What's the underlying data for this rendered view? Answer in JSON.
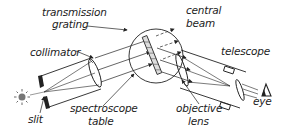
{
  "diagram": {
    "labels": {
      "transmission": "transmission",
      "grating": "grating",
      "collimator": "collimator",
      "central_beam_1": "central",
      "central_beam_2": "beam",
      "telescope": "telescope",
      "slit": "slit",
      "spectroscope_table_1": "spectroscope",
      "spectroscope_table_2": "table",
      "objective_lens_1": "objective",
      "objective_lens_2": "lens",
      "eye": "eye"
    },
    "colors": {
      "ink": "#222222",
      "background": "#ffffff",
      "light_source": "#777777"
    }
  }
}
